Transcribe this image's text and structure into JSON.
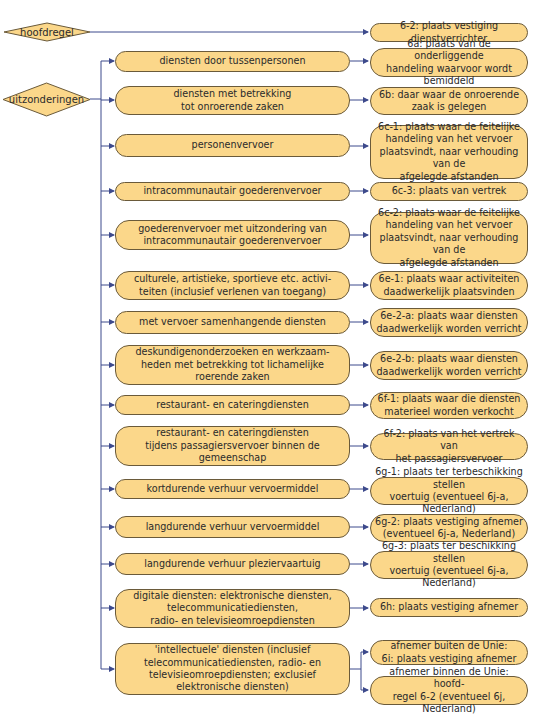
{
  "colors": {
    "box_fill": "#fbd78a",
    "box_border": "#6a5a3a",
    "connector": "#3d4a8c",
    "background": "#ffffff"
  },
  "main_rule": {
    "decision": "hoofdregel",
    "outcome": "6-2: plaats vestiging dienstverrichter"
  },
  "exceptions": {
    "decision": "uitzonderingen",
    "rows": [
      {
        "service": "diensten door tussenpersonen",
        "rule": "6a: plaats van de onderliggende\nhandeling waarvoor wordt bemiddeld"
      },
      {
        "service": "diensten met betrekking\ntot onroerende zaken",
        "rule": "6b: daar waar de onroerende\nzaak is gelegen"
      },
      {
        "service": "personenvervoer",
        "rule": "6c-1: plaats waar de feitelijke\nhandeling van het vervoer\nplaatsvindt, naar verhouding van de\nafgelegde afstanden"
      },
      {
        "service": "intracommunautair goederenvervoer",
        "rule": "6c-3: plaats van vertrek"
      },
      {
        "service": "goederenvervoer met uitzondering van\nintracommunautair goederenvervoer",
        "rule": "6c-2: plaats waar de feitelijke\nhandeling van het vervoer\nplaatsvindt, naar verhouding van de\nafgelegde afstanden"
      },
      {
        "service": "culturele, artistieke, sportieve etc. activi-\nteiten (inclusief verlenen van toegang)",
        "rule": "6e-1: plaats waar activiteiten\ndaadwerkelijk plaatsvinden"
      },
      {
        "service": "met vervoer samenhangende diensten",
        "rule": "6e-2-a: plaats waar diensten\ndaadwerkelijk worden verricht"
      },
      {
        "service": "deskundigenonderzoeken en werkzaam-\nheden met betrekking tot lichamelijke\nroerende zaken",
        "rule": "6e-2-b: plaats waar diensten\ndaadwerkelijk worden verricht"
      },
      {
        "service": "restaurant- en cateringdiensten",
        "rule": "6f-1: plaats waar die diensten\nmaterieel worden verkocht"
      },
      {
        "service": "restaurant- en cateringdiensten\ntijdens passagiersvervoer binnen de\ngemeenschap",
        "rule": "6f-2: plaats van het vertrek van\nhet passagiersvervoer"
      },
      {
        "service": "kortdurende verhuur vervoermiddel",
        "rule": "6g-1: plaats ter terbeschikking stellen\nvoertuig (eventueel 6j-a, Nederland)"
      },
      {
        "service": "langdurende verhuur vervoermiddel",
        "rule": "6g-2: plaats vestiging afnemer\n(eventueel 6j-a, Nederland)"
      },
      {
        "service": "langdurende verhuur pleziervaartuig",
        "rule": "6g-3: plaats ter beschikking stellen\nvoertuig (eventueel 6j-a, Nederland)"
      },
      {
        "service": "digitale diensten: elektronische diensten,\ntelecommunicatiediensten,\nradio- en televisieomroepdiensten",
        "rule": "6h: plaats vestiging afnemer"
      },
      {
        "service": "'intellectuele' diensten (inclusief\ntelecommunicatiediensten, radio- en\ntelevisieomroepdiensten; exclusief\nelektronische diensten)",
        "rule_outside_eu": "afnemer buiten de Unie:\n6i: plaats vestiging afnemer",
        "rule_inside_eu": "afnemer binnen de Unie: hoofd-\nregel 6-2 (eventueel 6j, Nederland)"
      }
    ]
  }
}
